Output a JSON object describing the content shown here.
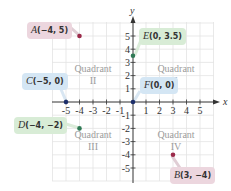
{
  "diagram": {
    "type": "coordinate-plane",
    "x_axis_label": "x",
    "y_axis_label": "y",
    "x_ticks": [
      "-5",
      "-4",
      "-3",
      "-2",
      "-1",
      "1",
      "2",
      "3",
      "4",
      "5"
    ],
    "y_ticks": [
      "5",
      "4",
      "3",
      "2",
      "1",
      "-1",
      "-2",
      "-3",
      "-4",
      "-5"
    ],
    "quadrants": [
      {
        "name": "Quadrant",
        "numeral": "I"
      },
      {
        "name": "Quadrant",
        "numeral": "II"
      },
      {
        "name": "Quadrant",
        "numeral": "III"
      },
      {
        "name": "Quadrant",
        "numeral": "IV"
      }
    ],
    "points": [
      {
        "name": "A",
        "coords": "(−4, 5)",
        "x": -4,
        "y": 5,
        "color": "#9b2a4a"
      },
      {
        "name": "B",
        "coords": "(3, −4)",
        "x": 3,
        "y": -4,
        "color": "#9b2a4a"
      },
      {
        "name": "C",
        "coords": "(−5, 0)",
        "x": -5,
        "y": 0,
        "color": "#1d2f6b"
      },
      {
        "name": "D",
        "coords": "(−4, −2)",
        "x": -4,
        "y": -2,
        "color": "#2f7a55"
      },
      {
        "name": "E",
        "coords": "(0, 3.5)",
        "x": 0,
        "y": 3.5,
        "color": "#2f7a55"
      },
      {
        "name": "F",
        "coords": "(0, 0)",
        "x": 0,
        "y": 0,
        "color": "#1d2f6b"
      }
    ]
  }
}
